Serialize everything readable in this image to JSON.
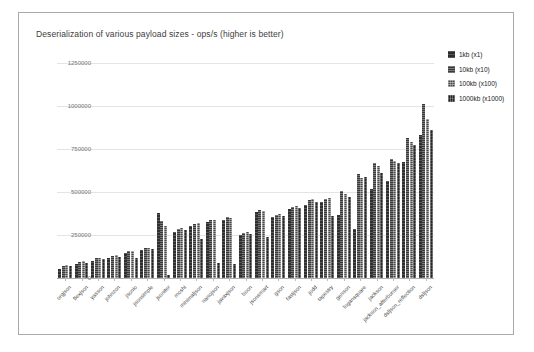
{
  "card": {
    "title": "Deserialization of various payload sizes  - ops/s (higher is better)"
  },
  "y_axis": {
    "tick_labels": [
      "0",
      "250000",
      "500000",
      "750000",
      "1000000",
      "1250000"
    ]
  },
  "legend": {
    "items": [
      {
        "label": "1kb (x1)"
      },
      {
        "label": "10kb (x10)"
      },
      {
        "label": "100kb (x100)"
      },
      {
        "label": "1000kb (x1000)"
      }
    ]
  },
  "chart_data": {
    "type": "bar",
    "title": "Deserialization of various payload sizes  - ops/s (higher is better)",
    "ylabel": "ops/s",
    "xlabel": "",
    "ylim": [
      0,
      1250000
    ],
    "yticks": [
      0,
      250000,
      500000,
      750000,
      1000000,
      1250000
    ],
    "grid": true,
    "legend_position": "right",
    "categories": [
      "orgjson",
      "flexjson",
      "yasson",
      "johnzon",
      "jsonio",
      "jsonsimple",
      "jsoniter",
      "moshi",
      "minimaljson",
      "nanojson",
      "javaxjson",
      "boon",
      "jsonsmart",
      "gson",
      "fastjson",
      "jodd",
      "tapestry",
      "genson",
      "logansquare",
      "jackson",
      "jackson_afterburner",
      "dsljson_reflection",
      "dsljson"
    ],
    "series": [
      {
        "name": "1kb (x1)",
        "values": [
          55000,
          80000,
          100000,
          118000,
          145000,
          160000,
          380000,
          270000,
          300000,
          325000,
          340000,
          250000,
          385000,
          355000,
          400000,
          423000,
          440000,
          365000,
          285000,
          520000,
          565000,
          675000,
          830000
        ]
      },
      {
        "name": "10kb (x10)",
        "values": [
          70000,
          95000,
          115000,
          128000,
          155000,
          172000,
          330000,
          283000,
          313000,
          335000,
          356000,
          262000,
          397000,
          368000,
          413000,
          452000,
          462000,
          505000,
          605000,
          668000,
          692000,
          815000,
          1010000
        ]
      },
      {
        "name": "100kb (x100)",
        "values": [
          78000,
          100000,
          118000,
          132000,
          158000,
          176000,
          300000,
          288000,
          317000,
          340000,
          346000,
          268000,
          390000,
          374000,
          418000,
          458000,
          466000,
          490000,
          580000,
          652000,
          683000,
          790000,
          925000
        ]
      },
      {
        "name": "1000kb (x1000)",
        "values": [
          68000,
          90000,
          108000,
          122000,
          115000,
          168000,
          15000,
          278000,
          225000,
          90000,
          80000,
          256000,
          240000,
          362000,
          408000,
          440000,
          360000,
          470000,
          588000,
          612000,
          670000,
          775000,
          860000
        ]
      }
    ]
  }
}
